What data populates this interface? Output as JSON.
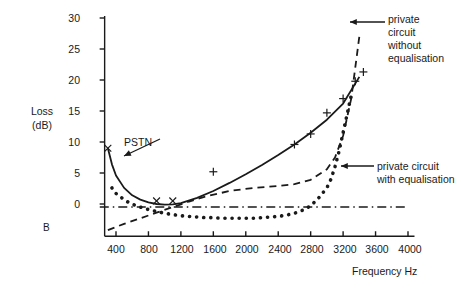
{
  "figure": {
    "corner_label": "B",
    "y_axis": {
      "label_line1": "Loss",
      "label_line2": "(dB)",
      "ticks": [
        "30",
        "25",
        "20",
        "15",
        "10",
        "5",
        "0"
      ]
    },
    "x_axis": {
      "label": "Frequency Hz",
      "ticks": [
        "400",
        "800",
        "1200",
        "1600",
        "2000",
        "2400",
        "2800",
        "3200",
        "3600",
        "4000"
      ]
    },
    "annotations": {
      "pstn": "PSTN",
      "without_eq_line1": "private",
      "without_eq_line2": "circuit",
      "without_eq_line3": "without",
      "without_eq_line4": "equalisation",
      "with_eq_line1": "private circuit",
      "with_eq_line2": "with equalisation"
    }
  },
  "chart_data": {
    "type": "line",
    "title": "",
    "xlabel": "Frequency Hz",
    "ylabel": "Loss (dB)",
    "xlim": [
      200,
      4000
    ],
    "ylim": [
      -5,
      31
    ],
    "yticks": [
      0,
      5,
      10,
      15,
      20,
      25,
      30
    ],
    "xticks": [
      400,
      800,
      1200,
      1600,
      2000,
      2400,
      2800,
      3200,
      3600,
      4000
    ],
    "grid": false,
    "legend": "annotations",
    "series": [
      {
        "name": "PSTN",
        "style": "solid",
        "marker": "x",
        "x": [
          300,
          350,
          400,
          500,
          600,
          700,
          800,
          900,
          1000,
          1100,
          1200,
          1400,
          1600,
          1800,
          2000,
          2200,
          2400,
          2600,
          2800,
          3000,
          3200,
          3400
        ],
        "y": [
          9.0,
          6.4,
          4.6,
          2.6,
          1.4,
          0.7,
          0.25,
          0.0,
          -0.1,
          -0.05,
          0.15,
          1.0,
          2.1,
          3.4,
          4.8,
          6.3,
          7.9,
          9.6,
          11.5,
          13.6,
          16.2,
          20.5
        ],
        "marker_points": [
          {
            "x": 300,
            "y": 9.0
          },
          {
            "x": 900,
            "y": 0.5
          },
          {
            "x": 1100,
            "y": 0.5
          },
          {
            "x": 1600,
            "y": 5.2
          },
          {
            "x": 2600,
            "y": 9.6
          },
          {
            "x": 2800,
            "y": 11.3
          },
          {
            "x": 3000,
            "y": 14.7
          },
          {
            "x": 3200,
            "y": 17.0
          },
          {
            "x": 3350,
            "y": 19.8
          },
          {
            "x": 3450,
            "y": 21.3
          }
        ],
        "marker_symbols": [
          "x",
          "x",
          "x",
          "+",
          "+",
          "+",
          "+",
          "+",
          "+",
          "+"
        ]
      },
      {
        "name": "private circuit without equalisation",
        "style": "dashed",
        "marker": "none",
        "x": [
          300,
          500,
          700,
          900,
          1100,
          1300,
          1500,
          1800,
          2100,
          2400,
          2600,
          2800,
          3000,
          3100,
          3200,
          3300,
          3400
        ],
        "y": [
          -4.2,
          -3.2,
          -2.3,
          -1.4,
          -0.5,
          0.4,
          1.2,
          2.1,
          2.6,
          2.9,
          3.2,
          3.9,
          5.6,
          7.5,
          11.0,
          17.0,
          27.0
        ]
      },
      {
        "name": "private circuit with equalisation",
        "style": "dotted",
        "marker": "none",
        "x": [
          350,
          400,
          450,
          500,
          550,
          600,
          650,
          700,
          750,
          800,
          900,
          1000,
          1100,
          1200,
          1300,
          1400,
          1500,
          1600,
          1700,
          1800,
          1900,
          2000,
          2100,
          2200,
          2300,
          2400,
          2500,
          2600,
          2700,
          2800,
          2900,
          3000,
          3050,
          3100,
          3150,
          3200,
          3250,
          3300
        ],
        "y": [
          2.6,
          1.7,
          1.2,
          0.7,
          0.3,
          0.0,
          -0.3,
          -0.5,
          -0.7,
          -0.9,
          -1.2,
          -1.5,
          -1.7,
          -1.9,
          -2.0,
          -2.1,
          -2.2,
          -2.2,
          -2.3,
          -2.3,
          -2.3,
          -2.3,
          -2.3,
          -2.2,
          -2.1,
          -2.0,
          -1.8,
          -1.5,
          -1.0,
          -0.3,
          1.0,
          2.6,
          4.0,
          6.0,
          8.5,
          11.5,
          14.5,
          17.5
        ]
      },
      {
        "name": "reference level",
        "style": "dash-dot",
        "marker": "none",
        "x": [
          200,
          4000
        ],
        "y": [
          -0.5,
          -0.5
        ]
      }
    ]
  }
}
